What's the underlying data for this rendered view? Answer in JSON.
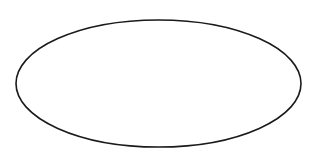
{
  "canvas": {
    "width": 319,
    "height": 158,
    "background": "#ffffff"
  },
  "shapes": [
    {
      "type": "ellipse",
      "cx": 158.5,
      "cy": 83.5,
      "rx": 142.5,
      "ry": 63.5,
      "stroke": "#1a1a1a",
      "stroke_width": 1.6,
      "fill": "none"
    }
  ]
}
